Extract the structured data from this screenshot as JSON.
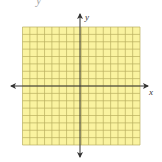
{
  "figure": {
    "type": "coordinate-grid",
    "clipped_top_text": "y",
    "grid": {
      "columns": 16,
      "rows": 16,
      "cells_left_of_y_axis": 8,
      "cells_right_of_y_axis": 8,
      "cells_above_x_axis": 8,
      "cells_below_x_axis": 8,
      "fill_color": "#FAF3A0",
      "line_color": "#B9AF5E"
    },
    "axes": {
      "x_label": "x",
      "y_label": "y",
      "color": "#333333",
      "arrows": [
        "left",
        "right",
        "up",
        "down"
      ]
    }
  }
}
